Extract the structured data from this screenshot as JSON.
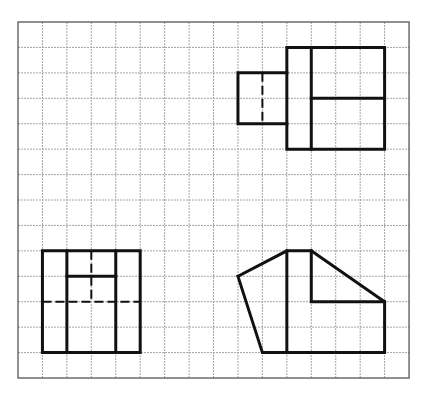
{
  "diagram": {
    "type": "orthographic-projection-views-on-grid",
    "grid": {
      "origin_px": [
        18,
        22
      ],
      "cols": 16,
      "rows": 14,
      "cell_w": 24.44,
      "cell_h": 25.43,
      "line_color": "#9a9a9a",
      "border_color": "#555555"
    },
    "stroke_color": "#111111",
    "views": [
      {
        "name": "front-view-top-right",
        "solid_polylines": [
          [
            [
              11,
              1
            ],
            [
              15,
              1
            ],
            [
              15,
              5
            ],
            [
              11,
              5
            ],
            [
              11,
              1
            ]
          ],
          [
            [
              12,
              1
            ],
            [
              12,
              5
            ]
          ],
          [
            [
              12,
              3
            ],
            [
              15,
              3
            ]
          ],
          [
            [
              11,
              2
            ],
            [
              9,
              2
            ],
            [
              9,
              4
            ],
            [
              11,
              4
            ]
          ]
        ],
        "dashed_lines": [
          [
            [
              10,
              2
            ],
            [
              10,
              4
            ]
          ]
        ]
      },
      {
        "name": "top-view-bottom-left",
        "solid_polylines": [
          [
            [
              1,
              9
            ],
            [
              5,
              9
            ],
            [
              5,
              13
            ],
            [
              1,
              13
            ],
            [
              1,
              9
            ]
          ],
          [
            [
              2,
              9
            ],
            [
              2,
              13
            ]
          ],
          [
            [
              4,
              9
            ],
            [
              4,
              13
            ]
          ],
          [
            [
              2,
              10
            ],
            [
              4,
              10
            ]
          ]
        ],
        "dashed_lines": [
          [
            [
              3,
              9
            ],
            [
              3,
              11
            ]
          ],
          [
            [
              1,
              11
            ],
            [
              5,
              11
            ]
          ]
        ]
      },
      {
        "name": "side-view-bottom-right",
        "solid_polylines": [
          [
            [
              9,
              10
            ],
            [
              11,
              9
            ],
            [
              12,
              9
            ],
            [
              15,
              11
            ],
            [
              15,
              13
            ],
            [
              10,
              13
            ],
            [
              9,
              10
            ]
          ],
          [
            [
              11,
              9
            ],
            [
              11,
              13
            ]
          ],
          [
            [
              12,
              9
            ],
            [
              12,
              11
            ],
            [
              15,
              11
            ]
          ]
        ],
        "dashed_lines": []
      }
    ]
  }
}
